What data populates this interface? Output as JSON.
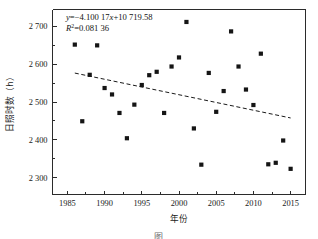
{
  "figure": {
    "caption_fragment": "图"
  },
  "annotations": {
    "equation_prefix": "y",
    "equation_body": "=−4.100 17",
    "equation_var": "x",
    "equation_tail": "+10 719.58",
    "r2_symbol": "R",
    "r2_exponent": "2",
    "r2_value": "=0.081 36"
  },
  "chart_data": {
    "type": "scatter",
    "title": "",
    "xlabel": "年份",
    "ylabel": "日照时数（h）",
    "xlim": [
      1983,
      2017
    ],
    "ylim": [
      2255,
      2745
    ],
    "xticks": [
      1985,
      1990,
      1995,
      2000,
      2005,
      2010,
      2015
    ],
    "xtick_labels": [
      "1985",
      "1990",
      "1995",
      "2000",
      "2005",
      "2010",
      "2015"
    ],
    "yticks": [
      2300,
      2400,
      2500,
      2600,
      2700
    ],
    "ytick_labels": [
      "2 300",
      "2 400",
      "2 500",
      "2 600",
      "2 700"
    ],
    "grid": false,
    "legend": "none",
    "minor_ticks_x": 1,
    "minor_ticks_y": 1,
    "marker": "square",
    "marker_color": "#151515",
    "series": [
      {
        "name": "日照时数",
        "x": [
          1986,
          1987,
          1988,
          1989,
          1990,
          1991,
          1992,
          1993,
          1994,
          1995,
          1996,
          1997,
          1998,
          1999,
          2000,
          2001,
          2002,
          2003,
          2004,
          2005,
          2006,
          2007,
          2008,
          2009,
          2010,
          2011,
          2012,
          2013,
          2014,
          2015
        ],
        "y": [
          2652,
          2449,
          2572,
          2650,
          2537,
          2520,
          2471,
          2404,
          2493,
          2545,
          2571,
          2580,
          2471,
          2594,
          2618,
          2712,
          2430,
          2334,
          2577,
          2474,
          2529,
          2687,
          2594,
          2533,
          2492,
          2628,
          2335,
          2339,
          2398,
          2323
        ]
      }
    ],
    "trendline": {
      "type": "linear-dashed",
      "slope": -4.10017,
      "intercept": 10719.58,
      "equation": "y=−4.100 17x+10 719.58",
      "r_squared": 0.08136,
      "x_start": 1986,
      "x_end": 2015
    }
  }
}
